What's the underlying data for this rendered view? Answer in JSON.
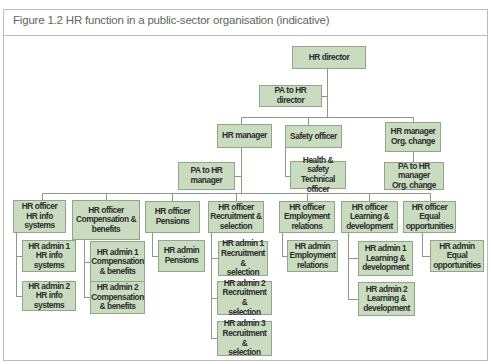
{
  "figure": {
    "title": "Figure 1.2  HR function in a public-sector organisation (indicative)"
  },
  "colors": {
    "box_fill": "#c9dcc0",
    "box_border": "#8fa688",
    "line": "#8a9a86",
    "title_text": "#5a6a5a"
  },
  "org_chart": {
    "director": "HR director",
    "pa_director": "PA to HR director",
    "hr_manager": "HR manager",
    "safety_officer": "Safety officer",
    "hr_manager_org": "HR manager\nOrg. change",
    "pa_hr_manager": "PA to HR\nmanager",
    "health_safety": "Health & safety\nTechnical officer",
    "pa_hr_manager_org": "PA to HR manager\nOrg. change",
    "officers": [
      {
        "label": "HR officer\nHR info systems",
        "admins": [
          "HR admin 1\nHR info systems",
          "HR admin 2\nHR info systems"
        ]
      },
      {
        "label": "HR officer\nCompensation &\nbenefits",
        "admins": [
          "HR admin 1\nCompensation\n& benefits",
          "HR admin 2\nCompensation\n& benefits"
        ]
      },
      {
        "label": "HR officer\nPensions",
        "admins": [
          "HR admin\nPensions"
        ]
      },
      {
        "label": "HR officer\nRecruitment &\nselection",
        "admins": [
          "HR admin 1\nRecruitment &\nselection",
          "HR admin 2\nRecruitment &\nselection",
          "HR admin 3\nRecruitment &\nselection"
        ]
      },
      {
        "label": "HR officer\nEmployment\nrelations",
        "admins": [
          "HR admin\nEmployment\nrelations"
        ]
      },
      {
        "label": "HR officer\nLearning &\ndevelopment",
        "admins": [
          "HR admin 1\nLearning &\ndevelopment",
          "HR admin 2\nLearning &\ndevelopment"
        ]
      },
      {
        "label": "HR officer\nEqual\nopportunities",
        "admins": [
          "HR admin\nEqual\nopportunities"
        ]
      }
    ]
  }
}
